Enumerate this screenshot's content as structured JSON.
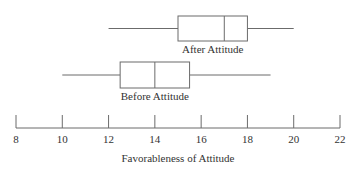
{
  "chart_data": {
    "type": "boxplot",
    "title": "",
    "xlabel": "Favorableness of Attitude",
    "ylabel": "",
    "xlim": [
      8,
      22
    ],
    "xticks": [
      8,
      10,
      12,
      14,
      16,
      18,
      20,
      22
    ],
    "grid": false,
    "legend": null,
    "series": [
      {
        "name": "After Attitude",
        "min": 12,
        "q1": 15,
        "median": 17,
        "q3": 18,
        "max": 20
      },
      {
        "name": "Before Attitude",
        "min": 10,
        "q1": 12.5,
        "median": 14,
        "q3": 15.5,
        "max": 19
      }
    ]
  },
  "colors": {
    "line": "#6b6b6b",
    "text": "#333333",
    "background": "#ffffff"
  }
}
